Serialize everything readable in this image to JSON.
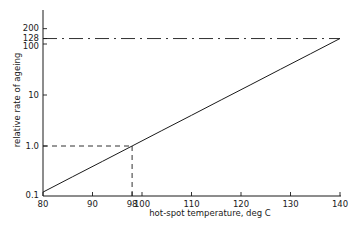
{
  "chart_data": {
    "type": "line",
    "title": "",
    "xlabel": "hot-spot temperature, deg C",
    "ylabel": "relative rate of ageing",
    "yscale": "log",
    "xlim": [
      80,
      140
    ],
    "ylim": [
      0.1,
      250
    ],
    "grid": false,
    "legend": "none",
    "x_ticks": [
      80,
      90,
      98,
      100,
      110,
      120,
      130,
      140
    ],
    "x_tick_labels": [
      "80",
      "90",
      "98",
      "100",
      "110",
      "120",
      "130",
      "140"
    ],
    "y_ticks": [
      0.1,
      1.0,
      10,
      100,
      128,
      200
    ],
    "y_tick_labels": [
      "0.1",
      "1.0",
      "10",
      "100",
      "128",
      "200"
    ],
    "series": [
      {
        "name": "relative rate of ageing",
        "style": "solid",
        "x": [
          80,
          86,
          92,
          98,
          104,
          110,
          116,
          122,
          128,
          134,
          140
        ],
        "y": [
          0.125,
          0.25,
          0.5,
          1.0,
          2,
          4,
          8,
          16,
          32,
          64,
          128
        ]
      }
    ],
    "annotations": [
      {
        "type": "dashed-hline",
        "y": 1.0,
        "x_from": 80,
        "x_to": 98
      },
      {
        "type": "dashed-vline",
        "x": 98,
        "y_from": 0.1,
        "y_to": 1.0
      },
      {
        "type": "dash-dot-hline",
        "y": 128,
        "x_from": 80,
        "x_to": 140
      }
    ]
  },
  "axes": {
    "xlabel": "hot-spot temperature, deg C",
    "ylabel": "relative rate of ageing"
  },
  "colors": {
    "ink": "#1a1a1a",
    "background": "#ffffff"
  }
}
